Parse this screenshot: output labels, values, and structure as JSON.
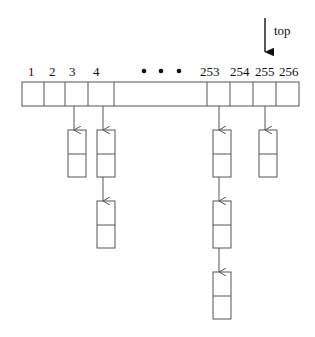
{
  "diagram": {
    "type": "hash-table-with-chained-buckets",
    "pointer_label": "top",
    "pointer_target_index": 255,
    "ellipsis": "• • •",
    "array_labels": [
      "1",
      "2",
      "3",
      "4",
      "253",
      "254",
      "255",
      "256"
    ],
    "chains": [
      {
        "bucket": "3",
        "length": 1
      },
      {
        "bucket": "4",
        "length": 2
      },
      {
        "bucket": "253",
        "length": 3
      },
      {
        "bucket": "255",
        "length": 1
      }
    ],
    "colors": {
      "stroke": "#555555",
      "text": "#111111",
      "background": "#ffffff"
    }
  }
}
